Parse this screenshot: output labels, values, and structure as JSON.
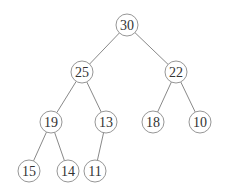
{
  "tree": {
    "type": "binary-max-heap",
    "nodes": [
      {
        "id": "n0",
        "value": "30",
        "x": 127,
        "y": 25
      },
      {
        "id": "n1",
        "value": "25",
        "x": 82,
        "y": 72
      },
      {
        "id": "n2",
        "value": "22",
        "x": 176,
        "y": 72
      },
      {
        "id": "n3",
        "value": "19",
        "x": 51,
        "y": 122
      },
      {
        "id": "n4",
        "value": "13",
        "x": 106,
        "y": 122
      },
      {
        "id": "n5",
        "value": "18",
        "x": 153,
        "y": 122
      },
      {
        "id": "n6",
        "value": "10",
        "x": 200,
        "y": 122
      },
      {
        "id": "n7",
        "value": "15",
        "x": 29,
        "y": 171
      },
      {
        "id": "n8",
        "value": "14",
        "x": 68,
        "y": 171
      },
      {
        "id": "n9",
        "value": "11",
        "x": 95,
        "y": 171
      }
    ],
    "edges": [
      [
        "n0",
        "n1"
      ],
      [
        "n0",
        "n2"
      ],
      [
        "n1",
        "n3"
      ],
      [
        "n1",
        "n4"
      ],
      [
        "n2",
        "n5"
      ],
      [
        "n2",
        "n6"
      ],
      [
        "n3",
        "n7"
      ],
      [
        "n3",
        "n8"
      ],
      [
        "n4",
        "n9"
      ]
    ]
  }
}
